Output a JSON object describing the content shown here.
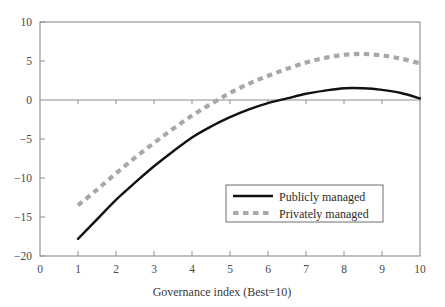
{
  "chart_data": {
    "type": "line",
    "title": "",
    "xlabel": "Governance index (Best=10)",
    "ylabel": "",
    "xlim": [
      0,
      10
    ],
    "ylim": [
      -20,
      10
    ],
    "xticks": [
      "0",
      "1",
      "2",
      "3",
      "4",
      "5",
      "6",
      "7",
      "8",
      "9",
      "10"
    ],
    "yticks": [
      "10",
      "5",
      "0",
      "−5",
      "−10",
      "−15",
      "−20"
    ],
    "xtick_values": [
      0,
      1,
      2,
      3,
      4,
      5,
      6,
      7,
      8,
      9,
      10
    ],
    "ytick_values": [
      10,
      5,
      0,
      -5,
      -10,
      -15,
      -20
    ],
    "grid": false,
    "legend_position": "center-right-lower",
    "x": [
      1,
      1.5,
      2,
      2.5,
      3,
      3.5,
      4,
      4.5,
      5,
      5.5,
      6,
      6.5,
      7,
      7.5,
      8,
      8.5,
      9,
      9.5,
      10
    ],
    "series": [
      {
        "name": "Publicly managed",
        "style": "solid",
        "color": "#111111",
        "values": [
          -17.8,
          -15.3,
          -12.8,
          -10.6,
          -8.5,
          -6.6,
          -4.8,
          -3.4,
          -2.2,
          -1.2,
          -0.4,
          0.2,
          0.8,
          1.2,
          1.5,
          1.5,
          1.3,
          0.9,
          0.2
        ],
        "zero_crossing": 6.6,
        "peak": {
          "x": 8.1,
          "y": 1.5
        }
      },
      {
        "name": "Privately managed",
        "style": "dashed",
        "color": "#a8a8a8",
        "values": [
          -13.5,
          -11.5,
          -9.4,
          -7.4,
          -5.5,
          -3.7,
          -2.0,
          -0.5,
          0.9,
          2.1,
          3.1,
          4.0,
          4.8,
          5.4,
          5.8,
          5.9,
          5.7,
          5.3,
          4.7
        ],
        "zero_crossing": 4.15,
        "peak": {
          "x": 8.4,
          "y": 5.9
        }
      }
    ],
    "legend": [
      {
        "label": "Publicly managed",
        "style": "solid",
        "color": "#111111"
      },
      {
        "label": "Privately managed",
        "style": "dashed",
        "color": "#a8a8a8"
      }
    ]
  }
}
